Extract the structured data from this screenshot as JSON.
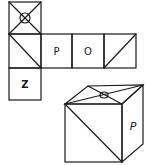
{
  "diagram": {
    "type": "cube-net-folding",
    "net": {
      "faces": [
        {
          "id": "top",
          "label": "",
          "mark": "x-diagonals-with-circle"
        },
        {
          "id": "middle-left",
          "label": "",
          "mark": "diagonal-tl-br"
        },
        {
          "id": "middle-p",
          "label": "P",
          "mark": "letter"
        },
        {
          "id": "middle-o",
          "label": "O",
          "mark": "letter"
        },
        {
          "id": "middle-right",
          "label": "",
          "mark": "diagonal-bl-tr"
        },
        {
          "id": "bottom",
          "label": "Z",
          "mark": "letter"
        }
      ]
    },
    "cube": {
      "top_face_mark": "x-diagonals-with-circle",
      "front_face_mark": "diagonal-tl-br",
      "right_face_label": "P"
    }
  }
}
